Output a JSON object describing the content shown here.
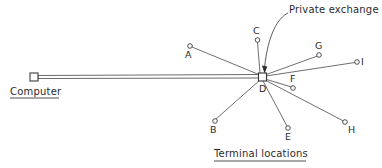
{
  "diagram": {
    "title_caption": "Terminal locations",
    "computer_caption": "Computer",
    "annotation": "Private exchange",
    "hub_label": "D",
    "canvas": {
      "width": 382,
      "height": 168
    },
    "colors": {
      "background": "#ffffff",
      "line": "#4a4a4a",
      "node_stroke": "#3d3d3d",
      "text": "#2b2b2b",
      "arrow": "#2e2e2e"
    },
    "computer_node": {
      "x": 34,
      "y": 78,
      "size": 8,
      "shape": "square"
    },
    "hub_node": {
      "x": 262,
      "y": 77,
      "size": 8,
      "shape": "square"
    },
    "trunk": {
      "from_x": 38,
      "from_y": 78,
      "to_x": 258,
      "to_y": 77,
      "style": "double-line"
    },
    "terminals": [
      {
        "id": "A",
        "label": "A",
        "cx": 190,
        "cy": 46,
        "r": 2.3,
        "label_x": 185,
        "label_y": 50
      },
      {
        "id": "B",
        "label": "B",
        "cx": 215,
        "cy": 121,
        "r": 2.3,
        "label_x": 210,
        "label_y": 125
      },
      {
        "id": "C",
        "label": "C",
        "cx": 257,
        "cy": 40,
        "r": 2.3,
        "label_x": 252,
        "label_y": 26
      },
      {
        "id": "E",
        "label": "E",
        "cx": 288,
        "cy": 128,
        "r": 2.3,
        "label_x": 284,
        "label_y": 132
      },
      {
        "id": "F",
        "label": "F",
        "cx": 293,
        "cy": 88,
        "r": 2.3,
        "label_x": 289,
        "label_y": 74
      },
      {
        "id": "G",
        "label": "G",
        "cx": 319,
        "cy": 55,
        "r": 2.3,
        "label_x": 314,
        "label_y": 41
      },
      {
        "id": "H",
        "label": "H",
        "cx": 345,
        "cy": 122,
        "r": 2.3,
        "label_x": 348,
        "label_y": 125
      },
      {
        "id": "I",
        "label": "I",
        "cx": 357,
        "cy": 62,
        "r": 2.3,
        "label_x": 361,
        "label_y": 57
      }
    ],
    "annotation_leader": {
      "text_x": 287,
      "text_y": 8,
      "arrow_tip_x": 264,
      "arrow_tip_y": 70
    },
    "captions": {
      "computer": {
        "x": 10,
        "y": 88,
        "underline": true
      },
      "terminal_locations": {
        "x": 214,
        "y": 150,
        "underline": true
      }
    }
  }
}
